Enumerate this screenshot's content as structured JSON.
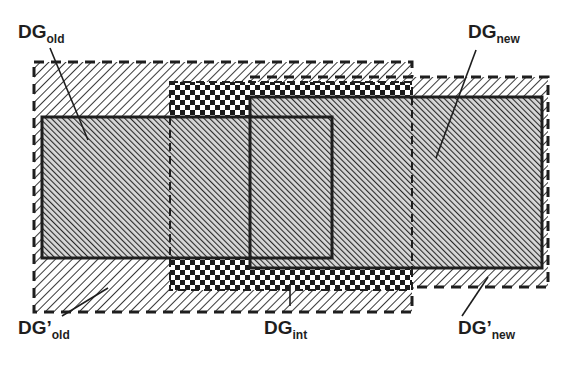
{
  "diagram": {
    "type": "overlapping-regions",
    "regions": [
      {
        "id": "dg-prime-old",
        "base": "DG",
        "prime": "’",
        "subscript": "old",
        "style": "dashed-border light-hatch"
      },
      {
        "id": "dg-old",
        "base": "DG",
        "prime": "",
        "subscript": "old",
        "style": "solid-border dense-hatch"
      },
      {
        "id": "dg-int",
        "base": "DG",
        "prime": "",
        "subscript": "int",
        "style": "dashed-border checkerboard"
      },
      {
        "id": "dg-prime-new",
        "base": "DG",
        "prime": "’",
        "subscript": "new",
        "style": "dashed-border light-hatch"
      },
      {
        "id": "dg-new",
        "base": "DG",
        "prime": "",
        "subscript": "new",
        "style": "solid-border dense-hatch"
      }
    ]
  },
  "labels": {
    "dg_old": {
      "base": "DG",
      "sub": "old"
    },
    "dg_new": {
      "base": "DG",
      "sub": "new"
    },
    "dg_prime_old": {
      "base": "DG’",
      "sub": "old"
    },
    "dg_int": {
      "base": "DG",
      "sub": "int"
    },
    "dg_prime_new": {
      "base": "DG’",
      "sub": "new"
    }
  },
  "colors": {
    "ink": "#1e1e1e",
    "background": "#ffffff"
  }
}
